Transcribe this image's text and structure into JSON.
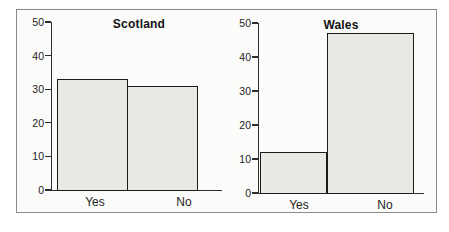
{
  "chart_data": [
    {
      "type": "bar",
      "title": "Scotland",
      "categories": [
        "Yes",
        "No"
      ],
      "values": [
        33,
        31
      ],
      "xlabel": "",
      "ylabel": "",
      "ylim": [
        0,
        50
      ],
      "yticks": [
        0,
        10,
        20,
        30,
        40,
        50
      ],
      "grid": false,
      "legend": false
    },
    {
      "type": "bar",
      "title": "Wales",
      "categories": [
        "Yes",
        "No"
      ],
      "values": [
        12,
        47
      ],
      "xlabel": "",
      "ylabel": "",
      "ylim": [
        0,
        50
      ],
      "yticks": [
        0,
        10,
        20,
        30,
        40,
        50
      ],
      "grid": false,
      "legend": false
    }
  ],
  "colors": {
    "bar_fill": "#e9e9e6",
    "bar_border": "#1c1c1c",
    "axis": "#2e2e2e",
    "text": "#1d1d1d",
    "frame_border": "#8a8a8a",
    "frame_background": "#fbfbf9",
    "page_background": "#ffffff"
  }
}
